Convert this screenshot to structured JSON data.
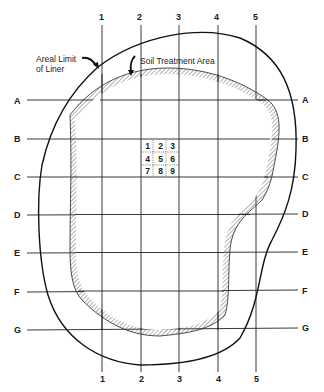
{
  "diagram": {
    "annotations": {
      "liner_line1": "Areal Limit",
      "liner_line2": "of Liner",
      "treatment": "Soil Treatment Area"
    },
    "columns": [
      "1",
      "2",
      "3",
      "4",
      "5"
    ],
    "rows": [
      "A",
      "B",
      "C",
      "D",
      "E",
      "F",
      "G"
    ],
    "grid_cells": [
      "1",
      "2",
      "3",
      "4",
      "5",
      "6",
      "7",
      "8",
      "9"
    ],
    "colors": {
      "line": "#1a1a1a",
      "hatch": "#555555",
      "background": "#ffffff"
    }
  }
}
